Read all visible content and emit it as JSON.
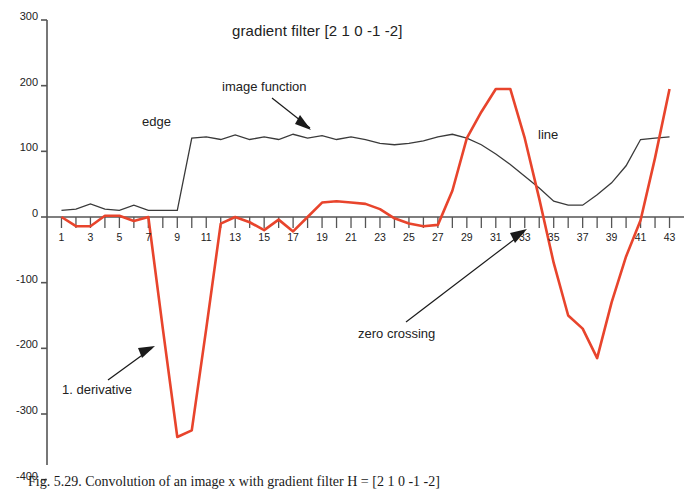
{
  "figure": {
    "caption": "Fig. 5.29. Convolution of an image x with gradient filter H = [2 1 0 -1 -2]"
  },
  "chart_data": {
    "type": "line",
    "title": "gradient filter [2 1 0 -1 -2]",
    "xlabel": "",
    "ylabel": "",
    "xlim": [
      0,
      44
    ],
    "ylim": [
      -400,
      300
    ],
    "grid": false,
    "legend": "none",
    "y_ticks": [
      300,
      200,
      100,
      0,
      -100,
      -200,
      -300,
      -400
    ],
    "x_ticks": [
      1,
      3,
      5,
      7,
      9,
      11,
      13,
      15,
      17,
      19,
      21,
      23,
      25,
      27,
      29,
      31,
      33,
      35,
      37,
      39,
      41,
      43
    ],
    "x_tick_step_minor": 1,
    "colors": {
      "image_function": "#3a3a3a",
      "derivative": "#e8442c",
      "axis": "#555555",
      "text": "#222222"
    },
    "x": [
      1,
      2,
      3,
      4,
      5,
      6,
      7,
      8,
      9,
      10,
      11,
      12,
      13,
      14,
      15,
      16,
      17,
      18,
      19,
      20,
      21,
      22,
      23,
      24,
      25,
      26,
      27,
      28,
      29,
      30,
      31,
      32,
      33,
      34,
      35,
      36,
      37,
      38,
      39,
      40,
      41,
      42,
      43
    ],
    "series": [
      {
        "name": "image function",
        "color": "#3a3a3a",
        "values": [
          10,
          12,
          20,
          12,
          10,
          18,
          10,
          10,
          10,
          120,
          122,
          118,
          125,
          118,
          122,
          118,
          126,
          120,
          124,
          118,
          122,
          118,
          112,
          110,
          112,
          116,
          122,
          126,
          120,
          110,
          96,
          80,
          62,
          44,
          24,
          18,
          18,
          34,
          52,
          78,
          118,
          120,
          122
        ]
      },
      {
        "name": "1. derivative",
        "color": "#e8442c",
        "values": [
          0,
          -14,
          -14,
          2,
          2,
          -6,
          0,
          -170,
          -335,
          -325,
          -170,
          -10,
          0,
          -8,
          -20,
          -4,
          -22,
          0,
          22,
          24,
          22,
          20,
          12,
          -2,
          -10,
          -14,
          -12,
          40,
          120,
          160,
          195,
          195,
          120,
          28,
          -70,
          -150,
          -170,
          -215,
          -130,
          -60,
          -5,
          90,
          195
        ]
      }
    ],
    "annotations": [
      {
        "id": "edge",
        "label": "edge",
        "x_px": 142,
        "y_px": 114,
        "has_arrow": false
      },
      {
        "id": "image-function",
        "label": "image function",
        "x_px": 222,
        "y_px": 79,
        "has_arrow": true
      },
      {
        "id": "line",
        "label": "line",
        "x_px": 538,
        "y_px": 127,
        "has_arrow": false
      },
      {
        "id": "zero-crossing",
        "label": "zero crossing",
        "x_px": 358,
        "y_px": 326,
        "has_arrow": true
      },
      {
        "id": "first-derivative",
        "label": "1. derivative",
        "x_px": 62,
        "y_px": 382,
        "has_arrow": true
      }
    ]
  }
}
